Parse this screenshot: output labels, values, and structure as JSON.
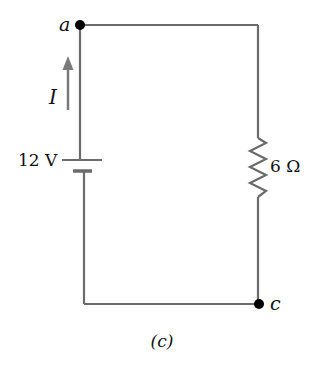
{
  "figure": {
    "caption": "(c)",
    "nodes": [
      {
        "id": "a",
        "label": "a"
      },
      {
        "id": "c",
        "label": "c"
      }
    ],
    "battery": {
      "label": "12 V",
      "voltage_value": 12,
      "unit": "V"
    },
    "resistor": {
      "label": "6 Ω",
      "resistance_value": 6,
      "unit": "Ω"
    },
    "current": {
      "label": "I",
      "direction": "up"
    },
    "colors": {
      "wire": "#6b6b6b",
      "node": "#000000",
      "arrow": "#7a7a7a",
      "text": "#111111",
      "background": "#ffffff"
    }
  }
}
